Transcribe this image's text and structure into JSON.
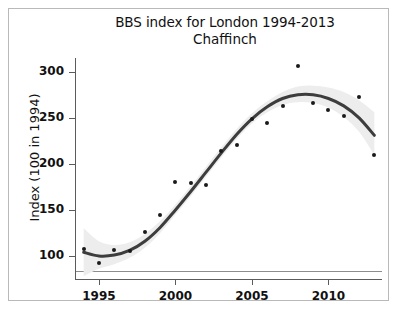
{
  "chart_data": {
    "type": "scatter",
    "title": "BBS index for London 1994-2013",
    "subtitle": "Chaffinch",
    "xlabel": "",
    "ylabel": "Index (100 in 1994)",
    "xlim": [
      1993.5,
      2013.5
    ],
    "ylim": [
      75,
      315
    ],
    "grid": false,
    "legend": null,
    "xticks": [
      1995,
      2000,
      2005,
      2010
    ],
    "yticks": [
      100,
      150,
      200,
      250,
      300
    ],
    "reference_line": {
      "y": 100,
      "color": "#8d8d8d"
    },
    "series": [
      {
        "name": "BBS index",
        "type": "scatter",
        "marker_color": "#1a1a1a",
        "x": [
          1994,
          1995,
          1996,
          1997,
          1998,
          1999,
          2000,
          2001,
          2002,
          2003,
          2004,
          2005,
          2006,
          2007,
          2008,
          2009,
          2010,
          2011,
          2012,
          2013
        ],
        "values": [
          108,
          92,
          107,
          105,
          126,
          145,
          180,
          179,
          177,
          214,
          220,
          249,
          244,
          263,
          306,
          266,
          259,
          252,
          273,
          210
        ]
      },
      {
        "name": "smoothed trend",
        "type": "line",
        "line_color": "#3d3d3d",
        "x": [
          1994,
          1995,
          1996,
          1997,
          1998,
          1999,
          2000,
          2001,
          2002,
          2003,
          2004,
          2005,
          2006,
          2007,
          2008,
          2009,
          2010,
          2011,
          2012,
          2013
        ],
        "values": [
          104,
          100,
          101,
          106,
          116,
          131,
          150,
          170,
          191,
          212,
          232,
          249,
          262,
          271,
          275,
          275,
          271,
          263,
          250,
          231
        ]
      },
      {
        "name": "confidence band",
        "type": "area",
        "fill_color": "#ededed",
        "x": [
          1994,
          1995,
          1996,
          1997,
          1998,
          1999,
          2000,
          2001,
          2002,
          2003,
          2004,
          2005,
          2006,
          2007,
          2008,
          2009,
          2010,
          2011,
          2012,
          2013
        ],
        "lower": [
          78,
          86,
          91,
          98,
          109,
          125,
          145,
          165,
          186,
          207,
          227,
          244,
          256,
          264,
          267,
          266,
          261,
          251,
          235,
          210
        ],
        "upper": [
          130,
          116,
          112,
          115,
          124,
          138,
          156,
          176,
          197,
          218,
          238,
          255,
          268,
          278,
          284,
          285,
          283,
          278,
          269,
          256
        ]
      }
    ]
  },
  "footer": {
    "note": ""
  }
}
